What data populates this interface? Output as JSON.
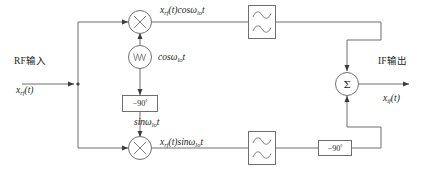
{
  "diagram": {
    "line_color": "#6f6f6f",
    "text_color": "#231f20"
  },
  "input": {
    "label": "RF输入",
    "signal_prefix": "x",
    "signal_sub": "rf",
    "signal_suffix": "(t)"
  },
  "output": {
    "label": "IF输出",
    "signal_prefix": "x",
    "signal_sub": "if",
    "signal_suffix": "(t)"
  },
  "mixers": [
    {
      "name": "upper-mixer",
      "glyph": "⊗"
    },
    {
      "name": "lower-mixer",
      "glyph": "⊗"
    }
  ],
  "oscillator": {
    "glyph": "waveform",
    "label_prefix": "cosω",
    "label_sub": "lo",
    "label_suffix": "t"
  },
  "phase_shifters": [
    {
      "name": "lo-phase-shifter",
      "text": "−90",
      "unit": "°"
    },
    {
      "name": "if-phase-shifter",
      "text": "−90",
      "unit": "°"
    }
  ],
  "branch_labels": {
    "upper": {
      "x": "x",
      "x_sub": "rf",
      "mid": "(t)cosω",
      "mid_sub": "lo",
      "tail": "t"
    },
    "lower": {
      "x": "x",
      "x_sub": "rf",
      "mid": "(t)sinω",
      "mid_sub": "lo",
      "tail": "t"
    },
    "lo_quadrature": {
      "prefix": "sinω",
      "sub": "lo",
      "suffix": "t"
    }
  },
  "filters": [
    {
      "name": "upper-bandpass-filter",
      "glyph": "filter-response-icon"
    },
    {
      "name": "lower-bandpass-filter",
      "glyph": "filter-response-icon"
    }
  ],
  "summer": {
    "glyph": "Σ"
  }
}
